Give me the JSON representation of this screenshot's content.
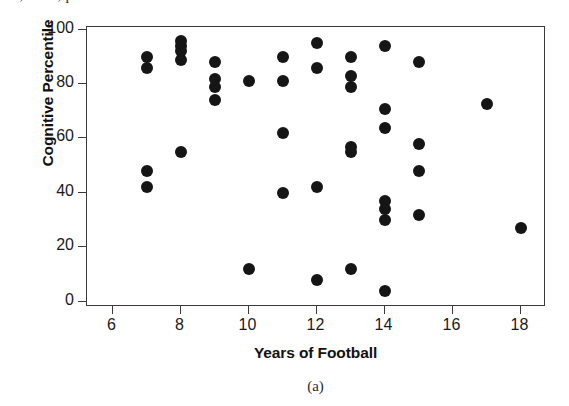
{
  "figure": {
    "citation_fragment": "10, 2011, p. 16.",
    "panel_caption": "(a)"
  },
  "chart_data": {
    "type": "scatter",
    "title": "",
    "xlabel": "Years of Football",
    "ylabel": "Cognitive Percentile",
    "xlim": [
      5.25,
      18.75
    ],
    "ylim": [
      -2,
      101
    ],
    "xticks": [
      6,
      8,
      10,
      12,
      14,
      16,
      18
    ],
    "xtick_labels": [
      "6",
      "8",
      "10",
      "12",
      "14",
      "16",
      "18"
    ],
    "yticks": [
      0,
      20,
      40,
      60,
      80,
      100
    ],
    "ytick_labels": [
      "0",
      "20",
      "40",
      "60",
      "80",
      "100"
    ],
    "grid": false,
    "legend": "none",
    "marker": "filled-circle",
    "marker_color": "#151515",
    "points": [
      {
        "x": 7,
        "y": 90
      },
      {
        "x": 7,
        "y": 86
      },
      {
        "x": 7,
        "y": 48
      },
      {
        "x": 7,
        "y": 42
      },
      {
        "x": 8,
        "y": 96
      },
      {
        "x": 8,
        "y": 94
      },
      {
        "x": 8,
        "y": 92
      },
      {
        "x": 8,
        "y": 89
      },
      {
        "x": 8,
        "y": 55
      },
      {
        "x": 9,
        "y": 88
      },
      {
        "x": 9,
        "y": 82
      },
      {
        "x": 9,
        "y": 79
      },
      {
        "x": 9,
        "y": 74
      },
      {
        "x": 10,
        "y": 81
      },
      {
        "x": 10,
        "y": 12
      },
      {
        "x": 11,
        "y": 90
      },
      {
        "x": 11,
        "y": 81
      },
      {
        "x": 11,
        "y": 62
      },
      {
        "x": 11,
        "y": 40
      },
      {
        "x": 12,
        "y": 95
      },
      {
        "x": 12,
        "y": 86
      },
      {
        "x": 12,
        "y": 42
      },
      {
        "x": 12,
        "y": 8
      },
      {
        "x": 13,
        "y": 90
      },
      {
        "x": 13,
        "y": 83
      },
      {
        "x": 13,
        "y": 79
      },
      {
        "x": 13,
        "y": 57
      },
      {
        "x": 13,
        "y": 55
      },
      {
        "x": 13,
        "y": 12
      },
      {
        "x": 14,
        "y": 94
      },
      {
        "x": 14,
        "y": 71
      },
      {
        "x": 14,
        "y": 64
      },
      {
        "x": 14,
        "y": 37
      },
      {
        "x": 14,
        "y": 34
      },
      {
        "x": 14,
        "y": 30
      },
      {
        "x": 14,
        "y": 4
      },
      {
        "x": 15,
        "y": 88
      },
      {
        "x": 15,
        "y": 58
      },
      {
        "x": 15,
        "y": 48
      },
      {
        "x": 15,
        "y": 32
      },
      {
        "x": 17,
        "y": 72.5
      },
      {
        "x": 18,
        "y": 27
      }
    ]
  }
}
